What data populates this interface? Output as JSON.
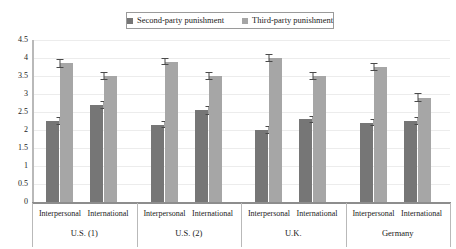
{
  "chart_data": {
    "type": "bar",
    "title": "",
    "xlabel": "",
    "ylabel": "",
    "ylim": [
      0,
      4.5
    ],
    "yticks": [
      "0",
      "0.5",
      "1",
      "1.5",
      "2",
      "2.5",
      "3",
      "3.5",
      "4",
      "4.5"
    ],
    "grid": true,
    "legend_position": "top-center",
    "groups": [
      "U.S. (1)",
      "U.S. (2)",
      "U.K.",
      "Germany"
    ],
    "subcategories": [
      "Interpersonal",
      "International"
    ],
    "categories": [
      "U.S. (1) Interpersonal",
      "U.S. (1) International",
      "U.S. (2) Interpersonal",
      "U.S. (2) International",
      "U.K. Interpersonal",
      "U.K. International",
      "Germany Interpersonal",
      "Germany International"
    ],
    "series": [
      {
        "name": "Second-party punishment",
        "color": "#767676",
        "values": [
          2.25,
          2.7,
          2.15,
          2.55,
          2.0,
          2.3,
          2.2,
          2.25
        ],
        "errors": [
          0.12,
          0.12,
          0.1,
          0.12,
          0.1,
          0.1,
          0.1,
          0.12
        ]
      },
      {
        "name": "Third-party punishment",
        "color": "#a6a6a6",
        "values": [
          3.85,
          3.5,
          3.9,
          3.5,
          4.0,
          3.5,
          3.75,
          2.9
        ],
        "errors": [
          0.12,
          0.12,
          0.1,
          0.12,
          0.1,
          0.12,
          0.1,
          0.12
        ]
      }
    ]
  },
  "legend": {
    "items": [
      {
        "label": "Second-party punishment",
        "color": "#767676"
      },
      {
        "label": "Third-party punishment",
        "color": "#a6a6a6"
      }
    ]
  },
  "axis": {
    "y_labels": [
      "4.5",
      "4",
      "3.5",
      "3",
      "2.5",
      "2",
      "1.5",
      "1",
      "0.5",
      "0"
    ]
  },
  "x_axis": {
    "groups": [
      {
        "name": "U.S. (1)",
        "sub": [
          "Interpersonal",
          "International"
        ]
      },
      {
        "name": "U.S. (2)",
        "sub": [
          "Interpersonal",
          "International"
        ]
      },
      {
        "name": "U.K.",
        "sub": [
          "Interpersonal",
          "International"
        ]
      },
      {
        "name": "Germany",
        "sub": [
          "Interpersonal",
          "International"
        ]
      }
    ]
  }
}
